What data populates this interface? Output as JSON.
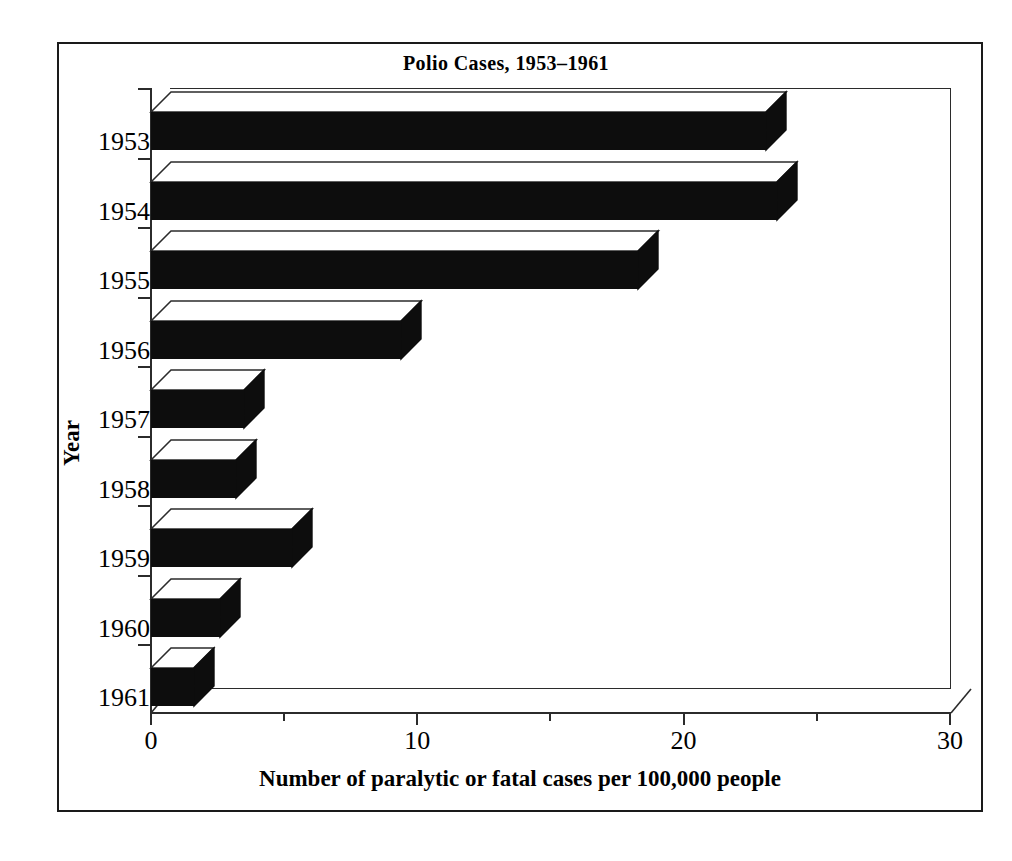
{
  "chart_data": {
    "type": "bar",
    "orientation": "horizontal",
    "style": "3d-extruded",
    "title": "Polio Cases, 1953–1961",
    "title_display": {
      "cap": "P",
      "rest": "OLIO ",
      "cap2": "C",
      "rest2": "ASES, 1953–1961"
    },
    "xlabel": "Number of paralytic or fatal cases per 100,000 people",
    "ylabel": "Year",
    "categories": [
      "1953",
      "1954",
      "1955",
      "1956",
      "1957",
      "1958",
      "1959",
      "1960",
      "1961"
    ],
    "values": [
      23.1,
      23.5,
      18.3,
      9.4,
      3.5,
      3.2,
      5.3,
      2.6,
      1.6
    ],
    "xlim": [
      0,
      30
    ],
    "xticks": [
      0,
      10,
      20,
      30
    ],
    "xtick_labels": [
      "0",
      "10",
      "20",
      "30"
    ],
    "xminor_ticks": [
      5,
      15,
      25
    ],
    "grid": false,
    "legend": false,
    "bar_face_color": "#0d0d0d",
    "bar_top_color": "#ffffff",
    "axis_color": "#2b2b2b",
    "background_color": "#ffffff"
  },
  "axes": {
    "x_label": "Number of paralytic or fatal cases per 100,000 people",
    "y_label": "Year"
  }
}
